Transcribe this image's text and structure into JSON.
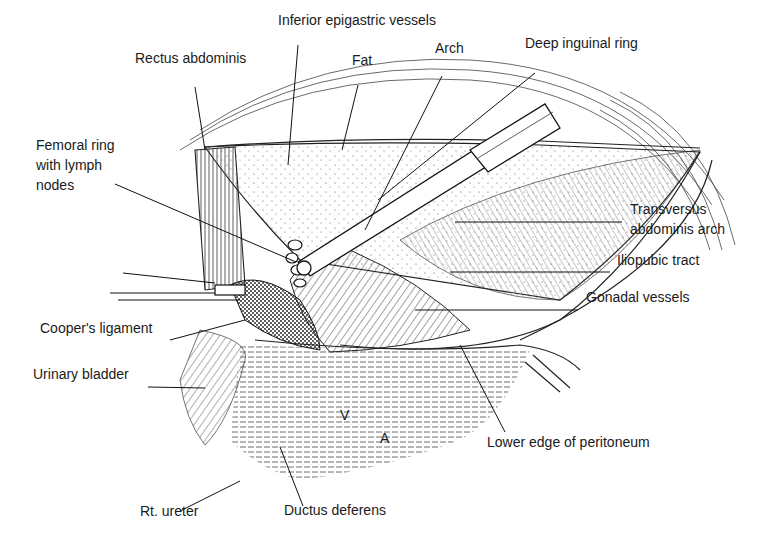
{
  "figure": {
    "labels": [
      {
        "id": "inferior-epigastric-vessels",
        "text": "Inferior epigastric vessels",
        "x": 278,
        "y": 25
      },
      {
        "id": "rectus-abdominis",
        "text": "Rectus abdominis",
        "x": 135,
        "y": 63
      },
      {
        "id": "fat",
        "text": "Fat",
        "x": 352,
        "y": 65
      },
      {
        "id": "arch",
        "text": "Arch",
        "x": 435,
        "y": 53
      },
      {
        "id": "deep-inguinal-ring",
        "text": "Deep inguinal ring",
        "x": 525,
        "y": 48
      },
      {
        "id": "femoral-ring-line1",
        "text": "Femoral ring",
        "x": 36,
        "y": 150
      },
      {
        "id": "femoral-ring-line2",
        "text": "with lymph",
        "x": 36,
        "y": 170
      },
      {
        "id": "femoral-ring-line3",
        "text": "nodes",
        "x": 36,
        "y": 190
      },
      {
        "id": "transversus-line1",
        "text": "Transversus",
        "x": 630,
        "y": 214
      },
      {
        "id": "transversus-line2",
        "text": "abdominis arch",
        "x": 630,
        "y": 234
      },
      {
        "id": "iliopubic-tract",
        "text": "Iliopubic tract",
        "x": 617,
        "y": 265
      },
      {
        "id": "gonadal-vessels",
        "text": "Gonadal vessels",
        "x": 586,
        "y": 302
      },
      {
        "id": "coopers-ligament",
        "text": "Cooper's ligament",
        "x": 40,
        "y": 333
      },
      {
        "id": "urinary-bladder",
        "text": "Urinary bladder",
        "x": 33,
        "y": 379
      },
      {
        "id": "lower-edge-peritoneum",
        "text": "Lower edge of peritoneum",
        "x": 487,
        "y": 447
      },
      {
        "id": "rt-ureter",
        "text": "Rt. ureter",
        "x": 140,
        "y": 516
      },
      {
        "id": "ductus-deferens",
        "text": "Ductus deferens",
        "x": 284,
        "y": 515
      }
    ],
    "marks": [
      {
        "id": "vein-mark",
        "text": "V",
        "x": 340,
        "y": 420
      },
      {
        "id": "artery-mark",
        "text": "A",
        "x": 380,
        "y": 443
      }
    ]
  }
}
